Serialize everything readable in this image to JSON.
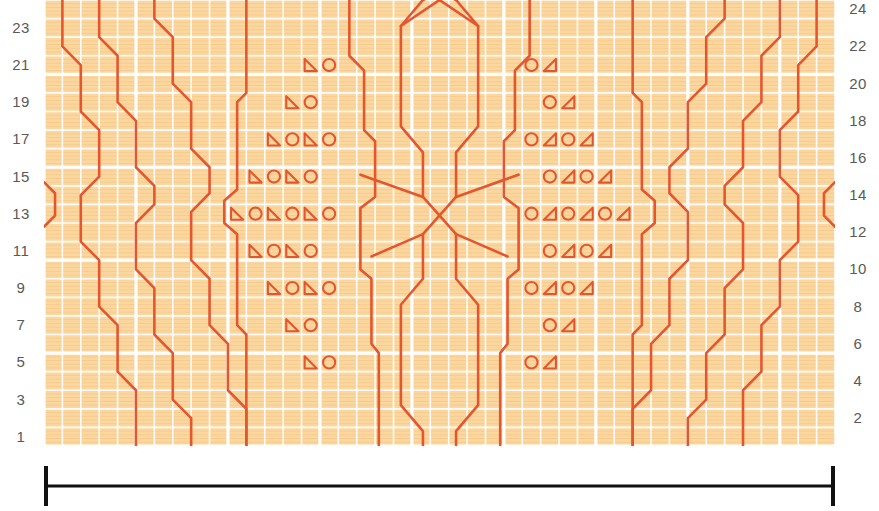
{
  "meta": {
    "grid": {
      "columns": 43,
      "rows": 24,
      "cell_width": 18.4,
      "cell_height": 18.58,
      "background_color": "#fbd7a0",
      "gridline_color": "#ffffff",
      "minor_line_color": "#f7c98a",
      "bold_every": 5
    },
    "ink_color": "#e4572e",
    "ink_width": 2.6,
    "bracket_color": "#111111"
  },
  "axes": {
    "left": {
      "label_color": "#595959",
      "ticks": [
        "23",
        "21",
        "19",
        "17",
        "15",
        "13",
        "11",
        "9",
        "7",
        "5",
        "3",
        "1"
      ],
      "rows": [
        23,
        21,
        19,
        17,
        15,
        13,
        11,
        9,
        7,
        5,
        3,
        1
      ]
    },
    "right": {
      "label_color": "#595959",
      "ticks": [
        "24",
        "22",
        "20",
        "18",
        "16",
        "14",
        "12",
        "10",
        "8",
        "6",
        "4",
        "2"
      ],
      "rows": [
        24,
        22,
        20,
        18,
        16,
        14,
        12,
        10,
        8,
        6,
        4,
        2
      ]
    }
  },
  "bracket": {
    "name": "pattern-repeat-width-bracket",
    "color": "#111111",
    "caption": ""
  },
  "chart_data": {
    "type": "table",
    "xlabel": "",
    "ylabel": "",
    "columns": 43,
    "rows": 24,
    "row_numbering": {
      "odd_rows_on": "left",
      "even_rows_on": "right",
      "direction": "bottom-to-top"
    },
    "symbol_legend": [
      {
        "key": "triangle-left",
        "name": "left-leaning-decrease",
        "glyph": "◺"
      },
      {
        "key": "triangle-right",
        "name": "right-leaning-decrease",
        "glyph": "◿"
      },
      {
        "key": "circle",
        "name": "yarn-over",
        "glyph": "○"
      }
    ],
    "symbols": [
      {
        "row": 21,
        "col": 15,
        "type": "triangle-left"
      },
      {
        "row": 21,
        "col": 16,
        "type": "circle"
      },
      {
        "row": 21,
        "col": 27,
        "type": "circle"
      },
      {
        "row": 21,
        "col": 28,
        "type": "triangle-right"
      },
      {
        "row": 19,
        "col": 14,
        "type": "triangle-left"
      },
      {
        "row": 19,
        "col": 15,
        "type": "circle"
      },
      {
        "row": 19,
        "col": 28,
        "type": "circle"
      },
      {
        "row": 19,
        "col": 29,
        "type": "triangle-right"
      },
      {
        "row": 17,
        "col": 13,
        "type": "triangle-left"
      },
      {
        "row": 17,
        "col": 14,
        "type": "circle"
      },
      {
        "row": 17,
        "col": 15,
        "type": "triangle-left"
      },
      {
        "row": 17,
        "col": 16,
        "type": "circle"
      },
      {
        "row": 17,
        "col": 27,
        "type": "circle"
      },
      {
        "row": 17,
        "col": 28,
        "type": "triangle-right"
      },
      {
        "row": 17,
        "col": 29,
        "type": "circle"
      },
      {
        "row": 17,
        "col": 30,
        "type": "triangle-right"
      },
      {
        "row": 15,
        "col": 12,
        "type": "triangle-left"
      },
      {
        "row": 15,
        "col": 13,
        "type": "circle"
      },
      {
        "row": 15,
        "col": 14,
        "type": "triangle-left"
      },
      {
        "row": 15,
        "col": 15,
        "type": "circle"
      },
      {
        "row": 15,
        "col": 28,
        "type": "circle"
      },
      {
        "row": 15,
        "col": 29,
        "type": "triangle-right"
      },
      {
        "row": 15,
        "col": 30,
        "type": "circle"
      },
      {
        "row": 15,
        "col": 31,
        "type": "triangle-right"
      },
      {
        "row": 13,
        "col": 11,
        "type": "triangle-left"
      },
      {
        "row": 13,
        "col": 12,
        "type": "circle"
      },
      {
        "row": 13,
        "col": 13,
        "type": "triangle-left"
      },
      {
        "row": 13,
        "col": 14,
        "type": "circle"
      },
      {
        "row": 13,
        "col": 15,
        "type": "triangle-left"
      },
      {
        "row": 13,
        "col": 16,
        "type": "circle"
      },
      {
        "row": 13,
        "col": 27,
        "type": "circle"
      },
      {
        "row": 13,
        "col": 28,
        "type": "triangle-right"
      },
      {
        "row": 13,
        "col": 29,
        "type": "circle"
      },
      {
        "row": 13,
        "col": 30,
        "type": "triangle-right"
      },
      {
        "row": 13,
        "col": 31,
        "type": "circle"
      },
      {
        "row": 13,
        "col": 32,
        "type": "triangle-right"
      },
      {
        "row": 11,
        "col": 12,
        "type": "triangle-left"
      },
      {
        "row": 11,
        "col": 13,
        "type": "circle"
      },
      {
        "row": 11,
        "col": 14,
        "type": "triangle-left"
      },
      {
        "row": 11,
        "col": 15,
        "type": "circle"
      },
      {
        "row": 11,
        "col": 28,
        "type": "circle"
      },
      {
        "row": 11,
        "col": 29,
        "type": "triangle-right"
      },
      {
        "row": 11,
        "col": 30,
        "type": "circle"
      },
      {
        "row": 11,
        "col": 31,
        "type": "triangle-right"
      },
      {
        "row": 9,
        "col": 13,
        "type": "triangle-left"
      },
      {
        "row": 9,
        "col": 14,
        "type": "circle"
      },
      {
        "row": 9,
        "col": 15,
        "type": "triangle-left"
      },
      {
        "row": 9,
        "col": 16,
        "type": "circle"
      },
      {
        "row": 9,
        "col": 27,
        "type": "circle"
      },
      {
        "row": 9,
        "col": 28,
        "type": "triangle-right"
      },
      {
        "row": 9,
        "col": 29,
        "type": "circle"
      },
      {
        "row": 9,
        "col": 30,
        "type": "triangle-right"
      },
      {
        "row": 7,
        "col": 14,
        "type": "triangle-left"
      },
      {
        "row": 7,
        "col": 15,
        "type": "circle"
      },
      {
        "row": 7,
        "col": 28,
        "type": "circle"
      },
      {
        "row": 7,
        "col": 29,
        "type": "triangle-right"
      },
      {
        "row": 5,
        "col": 15,
        "type": "triangle-left"
      },
      {
        "row": 5,
        "col": 16,
        "type": "circle"
      },
      {
        "row": 5,
        "col": 27,
        "type": "circle"
      },
      {
        "row": 5,
        "col": 28,
        "type": "triangle-right"
      }
    ],
    "travelling_lines": {
      "description": "Orange cable / travelling-stitch lines drawn over the grid",
      "left_diagonals": [
        [
          [
            3.4,
            24.0
          ],
          [
            3.4,
            12.6
          ],
          [
            6.2,
            10.0
          ],
          [
            6.2,
            6.0
          ],
          [
            9.0,
            3.4
          ],
          [
            9.0,
            0.0
          ]
        ],
        [
          [
            0.4,
            22.0
          ],
          [
            0.4,
            13.6
          ],
          [
            3.0,
            11.2
          ],
          [
            3.0,
            7.0
          ],
          [
            5.6,
            4.6
          ],
          [
            5.6,
            0.0
          ]
        ],
        [
          [
            0.4,
            12.2
          ],
          [
            0.4,
            11.0
          ],
          [
            3.0,
            8.6
          ],
          [
            3.0,
            4.6
          ],
          [
            5.6,
            2.2
          ],
          [
            5.6,
            0.0
          ]
        ]
      ],
      "note": "Mirrored on the right half of the chart"
    },
    "center_motif": {
      "description": "Two stacked elongated hexagons with crossing cables at top, middle and bottom",
      "hexagon_count": 2,
      "crossings": 3
    }
  }
}
